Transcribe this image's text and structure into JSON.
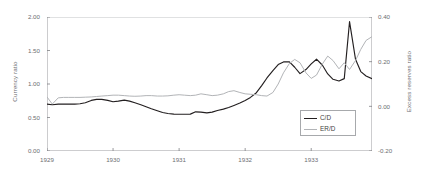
{
  "chart_data": {
    "type": "line",
    "title": "",
    "xlabel": "",
    "ylabel": "Currency ratio",
    "y2label": "Excess reserves ratio",
    "grid": false,
    "legend_position": "bottom-right",
    "xlim": [
      1929.0,
      1933.92
    ],
    "ylim": [
      0.0,
      2.0
    ],
    "y2lim": [
      -0.2,
      0.4
    ],
    "x_ticks": [
      "1929",
      "1930",
      "1931",
      "1932",
      "1933"
    ],
    "x_tick_values": [
      1929,
      1930,
      1931,
      1932,
      1933
    ],
    "y_ticks": [
      "0.00",
      "0.50",
      "1.00",
      "1.50",
      "2.00"
    ],
    "y_tick_values": [
      0.0,
      0.5,
      1.0,
      1.5,
      2.0
    ],
    "y2_ticks": [
      "-0.20",
      "0.00",
      "0.20",
      "0.40"
    ],
    "y2_tick_values": [
      -0.2,
      0.0,
      0.2,
      0.4
    ],
    "series": [
      {
        "name": "C/D",
        "axis": "left",
        "color": "#231f20",
        "x": [
          1929.0,
          1929.08,
          1929.17,
          1929.25,
          1929.33,
          1929.42,
          1929.5,
          1929.58,
          1929.67,
          1929.75,
          1929.83,
          1929.92,
          1930.0,
          1930.08,
          1930.17,
          1930.25,
          1930.33,
          1930.42,
          1930.5,
          1930.58,
          1930.67,
          1930.75,
          1930.83,
          1930.92,
          1931.0,
          1931.08,
          1931.17,
          1931.25,
          1931.33,
          1931.42,
          1931.5,
          1931.58,
          1931.67,
          1931.75,
          1931.83,
          1931.92,
          1932.0,
          1932.08,
          1932.17,
          1932.25,
          1932.33,
          1932.42,
          1932.5,
          1932.58,
          1932.67,
          1932.75,
          1932.83,
          1932.92,
          1933.0,
          1933.08,
          1933.17,
          1933.25,
          1933.33,
          1933.42,
          1933.5,
          1933.58,
          1933.67,
          1933.75,
          1933.83,
          1933.92
        ],
        "values": [
          0.7,
          0.69,
          0.7,
          0.7,
          0.7,
          0.7,
          0.705,
          0.72,
          0.755,
          0.77,
          0.77,
          0.755,
          0.735,
          0.745,
          0.76,
          0.745,
          0.72,
          0.69,
          0.66,
          0.63,
          0.6,
          0.575,
          0.56,
          0.55,
          0.548,
          0.548,
          0.55,
          0.585,
          0.58,
          0.57,
          0.58,
          0.605,
          0.625,
          0.65,
          0.68,
          0.715,
          0.755,
          0.8,
          0.87,
          0.975,
          1.09,
          1.2,
          1.29,
          1.33,
          1.33,
          1.25,
          1.155,
          1.215,
          1.3,
          1.37,
          1.28,
          1.15,
          1.07,
          1.045,
          1.08,
          1.93,
          1.37,
          1.185,
          1.12,
          1.08
        ],
        "peak_value": 1.93,
        "peak_x": 1933.58,
        "final_value": 1.08
      },
      {
        "name": "ER/D",
        "axis": "right",
        "color": "#b2b4b7",
        "x": [
          1929.0,
          1929.08,
          1929.17,
          1929.25,
          1929.33,
          1929.42,
          1929.5,
          1929.58,
          1929.67,
          1929.75,
          1929.83,
          1929.92,
          1930.0,
          1930.08,
          1930.17,
          1930.25,
          1930.33,
          1930.42,
          1930.5,
          1930.58,
          1930.67,
          1930.75,
          1930.83,
          1930.92,
          1931.0,
          1931.08,
          1931.17,
          1931.25,
          1931.33,
          1931.42,
          1931.5,
          1931.58,
          1931.67,
          1931.75,
          1931.83,
          1931.92,
          1932.0,
          1932.08,
          1932.17,
          1932.25,
          1932.33,
          1932.42,
          1932.5,
          1932.58,
          1932.67,
          1932.75,
          1932.83,
          1932.92,
          1933.0,
          1933.08,
          1933.17,
          1933.25,
          1933.33,
          1933.42,
          1933.5,
          1933.58,
          1933.67,
          1933.75,
          1933.83,
          1933.92
        ],
        "values": [
          0.042,
          0.01,
          0.038,
          0.04,
          0.04,
          0.04,
          0.04,
          0.041,
          0.042,
          0.044,
          0.046,
          0.048,
          0.05,
          0.05,
          0.048,
          0.046,
          0.045,
          0.046,
          0.048,
          0.048,
          0.046,
          0.046,
          0.047,
          0.05,
          0.052,
          0.05,
          0.048,
          0.05,
          0.056,
          0.052,
          0.048,
          0.05,
          0.056,
          0.066,
          0.07,
          0.062,
          0.056,
          0.054,
          0.052,
          0.048,
          0.046,
          0.062,
          0.1,
          0.15,
          0.192,
          0.21,
          0.195,
          0.15,
          0.125,
          0.14,
          0.19,
          0.225,
          0.205,
          0.168,
          0.195,
          0.165,
          0.205,
          0.255,
          0.295,
          0.312
        ],
        "peak_value": 0.312,
        "peak_x": 1933.92,
        "final_value": 0.312
      }
    ]
  },
  "legend": {
    "entries": [
      {
        "label": "C/D",
        "color": "#231f20"
      },
      {
        "label": "ER/D",
        "color": "#b2b4b7"
      }
    ]
  },
  "colors": {
    "axis": "#808285",
    "frame": "#a7a9ac",
    "text": "#6d6e71",
    "background": "#ffffff"
  }
}
